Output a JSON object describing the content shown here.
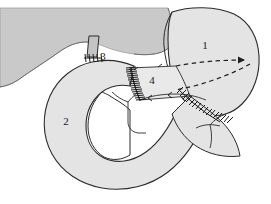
{
  "figure": {
    "caption": "",
    "width": 271,
    "height": 204,
    "background_color": "#ffffff"
  },
  "colors": {
    "liver_fill": "#c9c9c9",
    "organ_fill": "#e4e4e4",
    "organ_fill_light": "#ececec",
    "duct_fill": "#c4c4c4",
    "outline": "#2b2b2b",
    "suture": "#1a1a1a",
    "dashed_line": "#1f1f1f",
    "label_color": "#1a1a1a",
    "cut_surface": "#ffffff"
  },
  "structures": [
    {
      "id": "liver",
      "name": "liver",
      "fill": "#c9c9c9",
      "label": "",
      "description": "Large shaded mass occupying the upper-left of the field"
    },
    {
      "id": "stomach",
      "name": "stomach",
      "fill": "#e4e4e4",
      "label": "1",
      "label_x": 205,
      "label_y": 46,
      "description": "Rounded viscus at upper right marked with numeral 1"
    },
    {
      "id": "jejunal-loop",
      "name": "jejunal-loop",
      "fill": "#e4e4e4",
      "label": "2",
      "label_x": 66,
      "label_y": 122,
      "description": "C-shaped bowel loop sweeping through the lower field, marked 2"
    },
    {
      "id": "bile-duct",
      "name": "bile-duct",
      "fill": "#c4c4c4",
      "label": "3",
      "label_x": 103,
      "label_y": 57,
      "description": "Short tubular duct descending from the liver to the bowel, marked 3"
    },
    {
      "id": "anastomosed-segment",
      "name": "anastomosed-segment",
      "fill": "#e9e9e9",
      "label": "4",
      "label_x": 152,
      "label_y": 81,
      "description": "Quadrilateral segment bounded by suture lines, marked 4"
    }
  ],
  "labels": [
    {
      "id": "label-1",
      "text": "1",
      "x": 205,
      "y": 46,
      "refers_to": "stomach"
    },
    {
      "id": "label-2",
      "text": "2",
      "x": 66,
      "y": 122,
      "refers_to": "jejunal-loop"
    },
    {
      "id": "label-3",
      "text": "3",
      "x": 103,
      "y": 57,
      "refers_to": "bile-duct"
    },
    {
      "id": "label-4",
      "text": "4",
      "x": 152,
      "y": 81,
      "refers_to": "anastomosed-segment"
    }
  ],
  "suture_lines": [
    {
      "id": "suture-duct-anastomosis",
      "name": "duct-anastomosis-suture",
      "stitch_count": 5,
      "orientation": "horizontal-short",
      "description": "Short row of stitches where the duct meets the bowel wall near label 3"
    },
    {
      "id": "suture-vertical",
      "name": "vertical-anastomosis-suture",
      "stitch_count": 17,
      "orientation": "vertical",
      "description": "Long vertical ladder of stitches left of label 4"
    },
    {
      "id": "suture-diagonal",
      "name": "diagonal-anastomosis-suture",
      "stitch_count": 16,
      "orientation": "diagonal",
      "description": "Diagonal ladder of stitches running down and right from below label 4"
    }
  ],
  "dashed_lines": [
    {
      "id": "dashed-upper",
      "name": "upper-dashed-guide",
      "has_arrowhead": true,
      "description": "Upper dashed guide line sweeping right to an arrowhead"
    },
    {
      "id": "dashed-lower",
      "name": "lower-dashed-guide",
      "has_arrowhead": false,
      "description": "Lower dashed guide line returning leftwards forming a wedge"
    }
  ]
}
